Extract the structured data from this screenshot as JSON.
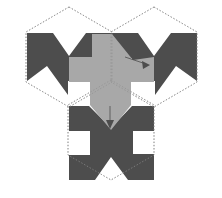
{
  "figure": {
    "type": "geometric-diagram",
    "canvas": {
      "width": 222,
      "height": 198
    },
    "background_color": "#ffffff"
  },
  "palette": {
    "dark_tile": "#4d4d4d",
    "light_tile": "#a8a8a8",
    "guide_line": "#8f8f8f",
    "arrow": "#4d4d4d",
    "white": "#ffffff"
  },
  "guides": {
    "stroke_color": "#8f8f8f",
    "stroke_width": 0.7,
    "dash_pattern": "1.4 1.8",
    "label": "dotted construction hexagons",
    "hexagons": [
      {
        "name": "hexagon-top-left",
        "center_x": 69,
        "center_y": 57,
        "radius": 50,
        "points": "69,7 112,32 112,82 69,107 26,82 26,32"
      },
      {
        "name": "hexagon-top-right",
        "center_x": 154,
        "center_y": 57,
        "radius": 50,
        "points": "154,7 197,32 197,82 154,107 111,82 111,32"
      },
      {
        "name": "hexagon-bottom-center",
        "center_x": 111,
        "center_y": 130,
        "radius": 50,
        "points": "111,80 154,105 154,155 111,180 68,155 68,105"
      }
    ]
  },
  "tiles": [
    {
      "name": "tile-top-left",
      "fill": "#4d4d4d",
      "rotation_deg": 0,
      "points": "27,33 53,33 69,56 86,33 112,33 112,58 91,58 91,81 68,81 68,95 47,66 27,81"
    },
    {
      "name": "tile-top-right",
      "fill": "#4d4d4d",
      "rotation_deg": 0,
      "points": "112,33 138,33 154,56 171,33 197,33 197,81 176,66 155,95 155,81 132,81 132,58 112,58"
    },
    {
      "name": "tile-bottom-center",
      "fill": "#4d4d4d",
      "rotation_deg": 180,
      "points": "89,106 111,128 132,106 154,106 154,131 133,131 133,154 154,154 154,180 128,180 111,157 95,180 69,180 69,155 90,155 90,131 69,131 69,106"
    },
    {
      "name": "tile-center-light",
      "fill": "#a8a8a8",
      "rotation_deg": 120,
      "points": "69,57 92,57 92,34 112,34 133,60 154,57 154,82 131,82 131,105 111,130 90,105 90,82 69,82"
    }
  ],
  "arrows": [
    {
      "name": "arrow-right-rotation-marker",
      "label": "rotation indicator, upper right",
      "tail_x": 125,
      "tail_y": 57,
      "head_x": 149,
      "head_y": 65,
      "head_size": 5.5
    },
    {
      "name": "arrow-bottom-rotation-marker",
      "label": "rotation indicator, lower center",
      "tail_x": 110,
      "tail_y": 106,
      "head_x": 110,
      "head_y": 128,
      "head_size": 5.5
    }
  ],
  "white_cuts": [
    {
      "name": "white-notch-top-left",
      "points": "27,58 47,66 27,81"
    },
    {
      "name": "white-notch-top-right",
      "points": "197,58 176,66 197,81"
    },
    {
      "name": "white-notch-bottom-left",
      "points": "69,131 90,140 69,155"
    },
    {
      "name": "white-notch-bottom-right",
      "points": "154,131 133,140 154,155"
    }
  ]
}
